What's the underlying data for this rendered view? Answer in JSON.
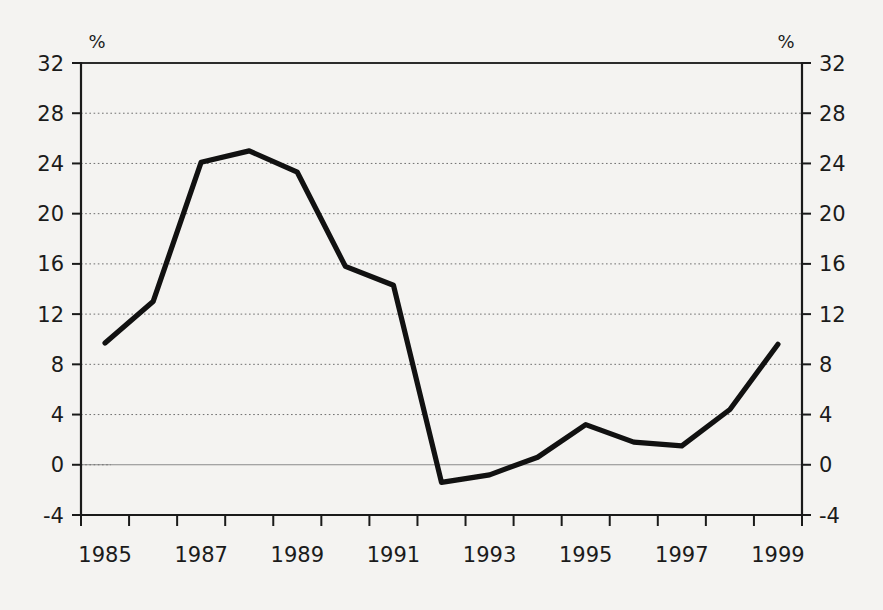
{
  "chart_data": {
    "type": "line",
    "title": "",
    "subtitle": "",
    "xlabel": "",
    "ylabel": "",
    "unit_label_left": "%",
    "unit_label_right": "%",
    "x": [
      1985,
      1986,
      1987,
      1988,
      1989,
      1990,
      1991,
      1992,
      1993,
      1994,
      1995,
      1996,
      1997,
      1998,
      1999
    ],
    "values": [
      9.7,
      13.0,
      24.1,
      25.0,
      23.3,
      15.8,
      14.3,
      -1.4,
      -0.8,
      0.6,
      3.2,
      1.8,
      1.5,
      4.4,
      9.6
    ],
    "series": [
      {
        "name": "",
        "values": [
          9.7,
          13.0,
          24.1,
          25.0,
          23.3,
          15.8,
          14.3,
          -1.4,
          -0.8,
          0.6,
          3.2,
          1.8,
          1.5,
          4.4,
          9.6
        ],
        "color": "#111111"
      }
    ],
    "ylim": [
      -4,
      32
    ],
    "yticks": [
      -4,
      0,
      4,
      8,
      12,
      16,
      20,
      24,
      28,
      32
    ],
    "ytick_labels_left": [
      "-4",
      "0",
      "4",
      "8",
      "12",
      "16",
      "20",
      "24",
      "28",
      "32"
    ],
    "ytick_labels_right": [
      "-4",
      "0",
      "4",
      "8",
      "12",
      "16",
      "20",
      "24",
      "28",
      "32"
    ],
    "xtick_labels": [
      "1985",
      "",
      "1987",
      "",
      "1989",
      "",
      "1991",
      "",
      "1993",
      "",
      "1995",
      "",
      "1997",
      "",
      "1999"
    ],
    "xtick_labels_shown": [
      "1985",
      "1987",
      "1989",
      "1991",
      "1993",
      "1995",
      "1997",
      "1999"
    ],
    "grid": true,
    "grid_style": "dotted-horizontal",
    "zero_line": true,
    "legend": "none",
    "background_color": "#f4f3f1",
    "line_color": "#111111",
    "axis_color": "#1a1a1a",
    "grid_color": "#6f6f6f"
  }
}
